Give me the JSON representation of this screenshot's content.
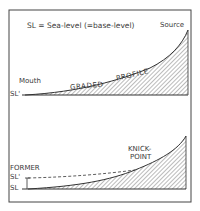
{
  "colors": {
    "ink": "#3a3a3a",
    "background": "#ffffff",
    "hatch": "#555555"
  },
  "top_panel": {
    "legend": "SL = Sea-level (=base-level)",
    "source_label": "Source",
    "mouth_label": "Mouth",
    "baseline_label": "SL'",
    "profile_label_1": "GRADED",
    "profile_label_2": "PROFILE"
  },
  "bottom_panel": {
    "former_label": "FORMER",
    "former_sl_label": "SL'",
    "sl_label": "SL",
    "knickpoint_label_1": "KNICK-",
    "knickpoint_label_2": "POINT"
  }
}
